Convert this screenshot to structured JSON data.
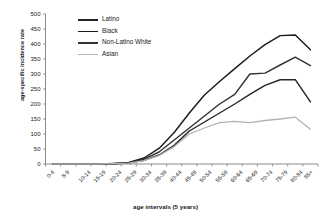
{
  "chart_data": {
    "type": "line",
    "title": "",
    "xlabel": "age intervals (5 years)",
    "ylabel": "age-specific incidence rate",
    "ylim": [
      0,
      500
    ],
    "yticks": [
      0,
      50,
      100,
      150,
      200,
      250,
      300,
      350,
      400,
      450,
      500
    ],
    "grid": false,
    "legend_position": "top-left",
    "categories": [
      "0-4",
      "5-9",
      "10-14",
      "15-19",
      "20-24",
      "25-29",
      "30-34",
      "35-39",
      "40-44",
      "45-49",
      "50-54",
      "55-59",
      "60-64",
      "65-69",
      "70-74",
      "75-79",
      "80-84",
      "85+"
    ],
    "series": [
      {
        "name": "Latino",
        "color": "#262626",
        "values": [
          0,
          0,
          0,
          0,
          1,
          3,
          12,
          30,
          62,
          110,
          140,
          170,
          200,
          232,
          262,
          281,
          281,
          207
        ]
      },
      {
        "name": "Black",
        "color": "#1a1a1a",
        "values": [
          0,
          0,
          0,
          0,
          2,
          5,
          20,
          52,
          105,
          170,
          230,
          275,
          318,
          360,
          398,
          428,
          430,
          381
        ]
      },
      {
        "name": "Non-Latino White",
        "color": "#333333",
        "values": [
          0,
          0,
          0,
          0,
          1,
          4,
          16,
          40,
          80,
          120,
          160,
          200,
          232,
          300,
          303,
          330,
          356,
          328
        ]
      },
      {
        "name": "Asian",
        "color": "#b3b3b3",
        "values": [
          0,
          0,
          0,
          0,
          1,
          3,
          11,
          28,
          58,
          100,
          120,
          138,
          142,
          138,
          145,
          150,
          156,
          116
        ]
      }
    ]
  },
  "legend": {
    "items": [
      {
        "label": "Latino",
        "color": "#262626"
      },
      {
        "label": "Black",
        "color": "#1a1a1a"
      },
      {
        "label": "Non-Latino White",
        "color": "#333333"
      },
      {
        "label": "Asian",
        "color": "#b3b3b3"
      }
    ]
  },
  "axis": {
    "line_color": "#808080",
    "tick_color": "#808080"
  }
}
